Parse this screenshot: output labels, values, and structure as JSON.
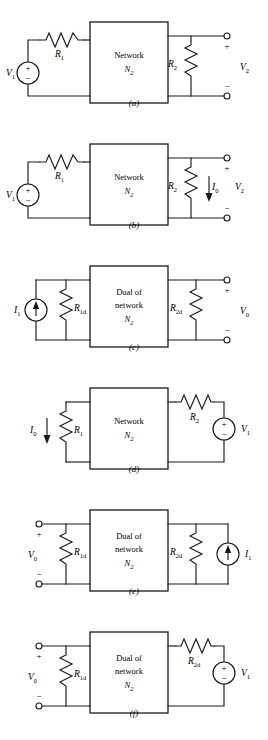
{
  "figure": {
    "panel_count": 6,
    "network_box_label_plain": "Network",
    "network_box_label_dual_line1": "Dual of",
    "network_box_label_dual_line2": "network",
    "network_box_symbol": "N",
    "network_box_symbol_sub": "2"
  },
  "panels": [
    {
      "id": "a",
      "label": "(a)",
      "box_type": "network",
      "box_lines": [
        "Network"
      ],
      "box_symbol": "N",
      "box_symbol_sub": "2",
      "left_source": {
        "kind": "voltage-source",
        "label": "V",
        "sub": "1",
        "plus": "+",
        "minus": "−"
      },
      "left_resistor": {
        "label": "R",
        "sub": "1",
        "orientation": "horizontal"
      },
      "right_resistor": {
        "label": "R",
        "sub": "2",
        "orientation": "vertical"
      },
      "right_terminals": {
        "label": "V",
        "sub": "2",
        "plus": "+",
        "minus": "−"
      },
      "current_arrow": null
    },
    {
      "id": "b",
      "label": "(b)",
      "box_type": "network",
      "box_lines": [
        "Network"
      ],
      "box_symbol": "N",
      "box_symbol_sub": "2",
      "left_source": {
        "kind": "voltage-source",
        "label": "V",
        "sub": "1",
        "plus": "+",
        "minus": "−"
      },
      "left_resistor": {
        "label": "R",
        "sub": "1",
        "orientation": "horizontal"
      },
      "right_resistor": {
        "label": "R",
        "sub": "2",
        "orientation": "vertical"
      },
      "right_terminals": {
        "label": "V",
        "sub": "2",
        "plus": "+",
        "minus": "−"
      },
      "current_arrow": {
        "label": "I",
        "sub": "0",
        "direction": "down"
      }
    },
    {
      "id": "c",
      "label": "(c)",
      "box_type": "dual",
      "box_lines": [
        "Dual of",
        "network"
      ],
      "box_symbol": "N",
      "box_symbol_sub": "2",
      "left_source": {
        "kind": "current-source",
        "label": "I",
        "sub": "1",
        "direction": "up"
      },
      "left_resistor": {
        "label": "R",
        "sub": "1d",
        "orientation": "vertical"
      },
      "right_resistor": {
        "label": "R",
        "sub": "2d",
        "orientation": "vertical"
      },
      "right_terminals": {
        "label": "V",
        "sub": "0",
        "plus": "+",
        "minus": "−"
      },
      "current_arrow": null
    },
    {
      "id": "d",
      "label": "(d)",
      "box_type": "network",
      "box_lines": [
        "Network"
      ],
      "box_symbol": "N",
      "box_symbol_sub": "2",
      "left_resistor": {
        "label": "R",
        "sub": "1",
        "orientation": "vertical"
      },
      "current_arrow": {
        "label": "I",
        "sub": "0",
        "direction": "down"
      },
      "right_resistor": {
        "label": "R",
        "sub": "2",
        "orientation": "horizontal"
      },
      "right_source": {
        "kind": "voltage-source",
        "label": "V",
        "sub": "1",
        "plus": "+",
        "minus": "−"
      }
    },
    {
      "id": "e",
      "label": "(e)",
      "box_type": "dual",
      "box_lines": [
        "Dual of",
        "network"
      ],
      "box_symbol": "N",
      "box_symbol_sub": "2",
      "left_terminals": {
        "label": "V",
        "sub": "0",
        "plus": "+",
        "minus": "−"
      },
      "left_resistor": {
        "label": "R",
        "sub": "1d",
        "orientation": "vertical"
      },
      "right_resistor": {
        "label": "R",
        "sub": "2d",
        "orientation": "vertical"
      },
      "right_source": {
        "kind": "current-source",
        "label": "I",
        "sub": "1",
        "direction": "up"
      }
    },
    {
      "id": "f",
      "label": "(f)",
      "box_type": "dual",
      "box_lines": [
        "Dual of",
        "network"
      ],
      "box_symbol": "N",
      "box_symbol_sub": "2",
      "left_terminals": {
        "label": "V",
        "sub": "0",
        "plus": "+",
        "minus": "−"
      },
      "left_resistor": {
        "label": "R",
        "sub": "1d",
        "orientation": "vertical"
      },
      "right_resistor": {
        "label": "R",
        "sub": "2d",
        "orientation": "horizontal"
      },
      "right_source": {
        "kind": "voltage-source",
        "label": "V",
        "sub": "1",
        "plus": "+",
        "minus": "−"
      }
    }
  ],
  "colors": {
    "ink": "#1a1a1a",
    "background": "#ffffff"
  }
}
